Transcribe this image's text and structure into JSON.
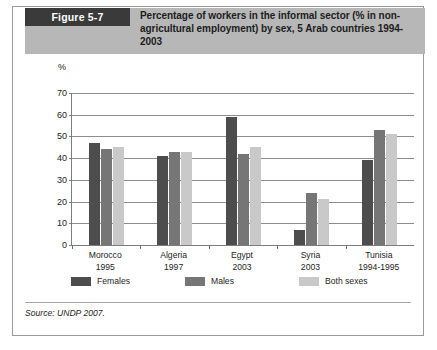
{
  "figure": {
    "badge_label": "Figure 5-7",
    "title": "Percentage of workers in the informal sector (% in non-agricultural employment) by sex, 5 Arab countries 1994-2003",
    "source": "Source: UNDP 2007."
  },
  "chart_data": {
    "type": "bar",
    "title": "Percentage of workers in the informal sector (% in non-agricultural employment) by sex, 5 Arab countries 1994-2003",
    "xlabel": "",
    "ylabel": "%",
    "ylim": [
      0,
      70
    ],
    "yticks": [
      0,
      10,
      20,
      30,
      40,
      50,
      60,
      70
    ],
    "grid": true,
    "legend_position": "bottom",
    "categories": [
      "Morocco",
      "Algeria",
      "Egypt",
      "Syria",
      "Tunisia"
    ],
    "category_years": [
      "1995",
      "1997",
      "2003",
      "2003",
      "1994-1995"
    ],
    "series": [
      {
        "name": "Females",
        "color": "#4d4d4d",
        "values": [
          47,
          41,
          59,
          7,
          39
        ]
      },
      {
        "name": "Males",
        "color": "#767676",
        "values": [
          44,
          43,
          42,
          24,
          53
        ]
      },
      {
        "name": "Both sexes",
        "color": "#c9c9c9",
        "values": [
          45,
          43,
          45,
          21,
          51
        ]
      }
    ]
  },
  "colors": {
    "header_band": "#b7b7b7",
    "badge": "#3a3a3a",
    "frame": "#9a9a9a",
    "axis": "#7d7d7d",
    "gridline": "#8d8d8d"
  }
}
